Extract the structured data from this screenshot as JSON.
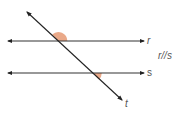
{
  "diagram": {
    "lines": [
      {
        "id": "r",
        "label": "r",
        "type": "parallel-line",
        "y": 41,
        "x1": 6,
        "x2": 146
      },
      {
        "id": "s",
        "label": "s",
        "type": "parallel-line",
        "y": 73,
        "x1": 6,
        "x2": 146
      },
      {
        "id": "t",
        "label": "t",
        "type": "transversal",
        "x1": 26,
        "y1": 11,
        "x2": 123,
        "y2": 101
      }
    ],
    "relation": "r//s",
    "angles": [
      {
        "at": "r-t intersection",
        "position": "above r, right of t",
        "color": "#e8a07c"
      },
      {
        "at": "s-t intersection",
        "position": "below s, left of t",
        "color": "#e8a07c"
      }
    ],
    "colors": {
      "line": "#222222",
      "angle_fill": "#e8a07c",
      "label": "#555555"
    }
  }
}
